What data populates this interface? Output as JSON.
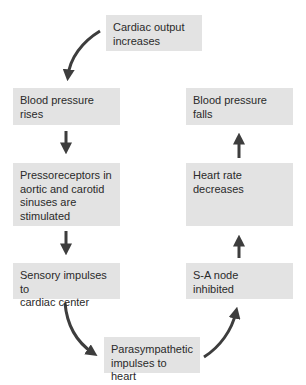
{
  "diagram": {
    "type": "cycle-flowchart",
    "colors": {
      "box_fill": "#e3e3e3",
      "text": "#2a2a2a",
      "arrow": "#3d3d3d",
      "background": "#ffffff"
    },
    "nodes": [
      {
        "id": "cardiac_output",
        "label": "Cardiac output\nincreases"
      },
      {
        "id": "bp_rises",
        "label": "Blood pressure\nrises"
      },
      {
        "id": "pressoreceptors",
        "label": "Pressoreceptors in\naortic and carotid\nsinuses are\nstimulated"
      },
      {
        "id": "sensory",
        "label": "Sensory impulses to\ncardiac center"
      },
      {
        "id": "parasympathetic",
        "label": "Parasympathetic\nimpulses to heart"
      },
      {
        "id": "sa_node",
        "label": "S-A node\ninhibited"
      },
      {
        "id": "heart_rate",
        "label": "Heart rate\ndecreases"
      },
      {
        "id": "bp_falls",
        "label": "Blood pressure\nfalls"
      }
    ],
    "edges": [
      {
        "from": "cardiac_output",
        "to": "bp_rises",
        "style": "curved"
      },
      {
        "from": "bp_rises",
        "to": "pressoreceptors",
        "style": "straight"
      },
      {
        "from": "pressoreceptors",
        "to": "sensory",
        "style": "straight"
      },
      {
        "from": "sensory",
        "to": "parasympathetic",
        "style": "curved"
      },
      {
        "from": "parasympathetic",
        "to": "sa_node",
        "style": "curved"
      },
      {
        "from": "sa_node",
        "to": "heart_rate",
        "style": "straight"
      },
      {
        "from": "heart_rate",
        "to": "bp_falls",
        "style": "straight"
      }
    ]
  }
}
